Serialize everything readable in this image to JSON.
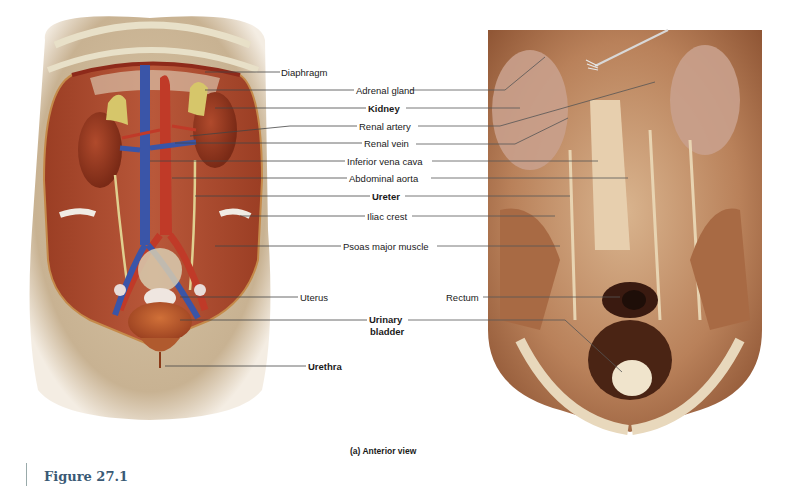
{
  "figure": {
    "number": "Figure 27.1",
    "caption": "(a) Anterior view"
  },
  "illustration": {
    "description": "Anterior view illustration of female urinary system in torso",
    "colors": {
      "skin": "#cdb898",
      "muscle": "#a8482c",
      "vein": "#3a55a8",
      "artery": "#c03a28",
      "adrenal": "#d6c66a",
      "kidney": "#9a3a22",
      "bladder": "#c0642e"
    }
  },
  "photo": {
    "description": "Cadaver dissection photograph, anterior view of posterior abdominal wall",
    "colors": {
      "tissue": "#b97a55",
      "pale": "#e6d0b0",
      "dark": "#3a1a10"
    }
  },
  "labels": [
    {
      "id": "diaphragm",
      "text": "Diaphragm",
      "bold": false,
      "x": 281,
      "y": 69
    },
    {
      "id": "adrenal-gland",
      "text": "Adrenal gland",
      "bold": false,
      "x": 356,
      "y": 86
    },
    {
      "id": "kidney",
      "text": "Kidney",
      "bold": true,
      "x": 368,
      "y": 104
    },
    {
      "id": "renal-artery",
      "text": "Renal artery",
      "bold": false,
      "x": 359,
      "y": 122
    },
    {
      "id": "renal-vein",
      "text": "Renal vein",
      "bold": false,
      "x": 364,
      "y": 140
    },
    {
      "id": "inferior-vena-cava",
      "text": "Inferior vena cava",
      "bold": false,
      "x": 347,
      "y": 157
    },
    {
      "id": "abdominal-aorta",
      "text": "Abdominal aorta",
      "bold": false,
      "x": 349,
      "y": 174
    },
    {
      "id": "ureter",
      "text": "Ureter",
      "bold": true,
      "x": 372,
      "y": 192
    },
    {
      "id": "iliac-crest",
      "text": "Iliac crest",
      "bold": false,
      "x": 367,
      "y": 212
    },
    {
      "id": "psoas-major",
      "text": "Psoas major muscle",
      "bold": false,
      "x": 343,
      "y": 242
    },
    {
      "id": "uterus",
      "text": "Uterus",
      "bold": false,
      "x": 300,
      "y": 293
    },
    {
      "id": "rectum",
      "text": "Rectum",
      "bold": false,
      "x": 446,
      "y": 293
    },
    {
      "id": "urinary-bladder-1",
      "text": "Urinary",
      "bold": true,
      "x": 369,
      "y": 314
    },
    {
      "id": "urinary-bladder-2",
      "text": "bladder",
      "bold": true,
      "x": 370,
      "y": 326
    },
    {
      "id": "urethra",
      "text": "Urethra",
      "bold": true,
      "x": 308,
      "y": 362
    }
  ]
}
